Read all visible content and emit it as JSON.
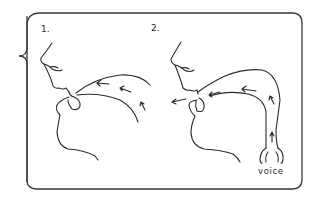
{
  "diagram": {
    "panels": [
      {
        "number": "1.",
        "description": "Head profile with arrows showing airflow passing through the mouth"
      },
      {
        "number": "2.",
        "description": "Head profile with arrows showing voice rising from the larynx through the throat and out the mouth"
      }
    ],
    "annotations": {
      "voice": "voice"
    },
    "colors": {
      "line": "#2a2a2a",
      "background": "#ffffff"
    }
  }
}
